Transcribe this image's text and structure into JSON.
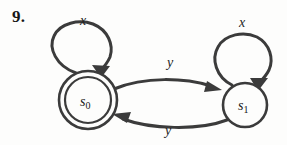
{
  "figure": {
    "exercise_number": "9.",
    "type": "finite-state-machine-transition-diagram",
    "background_color": "#fdfdfc",
    "stroke_color": "#3b3b3b"
  },
  "states": [
    {
      "id": "s0",
      "label": "s",
      "subscript": "0",
      "accepting": true,
      "cx": 88,
      "cy": 100,
      "outer_radius": 29,
      "inner_radius": 23
    },
    {
      "id": "s1",
      "label": "s",
      "subscript": "1",
      "accepting": false,
      "cx": 245,
      "cy": 105,
      "outer_radius": 22,
      "inner_radius": 0
    }
  ],
  "transitions": [
    {
      "id": "s0-self-loop",
      "from": "s0",
      "to": "s0",
      "input_label": "x",
      "kind": "self-loop",
      "label_x": 80,
      "label_y": 14
    },
    {
      "id": "s0-to-s1",
      "from": "s0",
      "to": "s1",
      "input_label": "y",
      "kind": "arc-top",
      "label_x": 167,
      "label_y": 56
    },
    {
      "id": "s1-self-loop",
      "from": "s1",
      "to": "s1",
      "input_label": "x",
      "kind": "self-loop",
      "label_x": 239,
      "label_y": 16
    },
    {
      "id": "s1-to-s0",
      "from": "s1",
      "to": "s0",
      "input_label": "y",
      "kind": "arc-bottom",
      "label_x": 165,
      "label_y": 124
    }
  ]
}
